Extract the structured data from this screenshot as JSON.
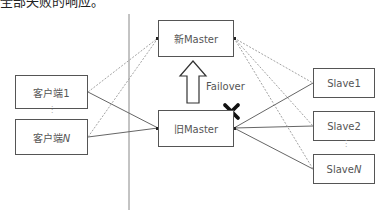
{
  "caption_fragment": "全部失败的响应。",
  "diagram": {
    "clients": [
      {
        "id": "client1",
        "label": "客户端1"
      },
      {
        "id": "clientN",
        "label_prefix": "客户端",
        "label_suffix": "N"
      }
    ],
    "masters": {
      "new": {
        "label": "新Master"
      },
      "old": {
        "label": "旧Master"
      }
    },
    "slaves": [
      {
        "id": "slave1",
        "label": "Slave1"
      },
      {
        "id": "slave2",
        "label": "Slave2"
      },
      {
        "id": "slaveN",
        "label_prefix": "Slave",
        "label_suffix": "N"
      }
    ],
    "failover_label": "Failover",
    "failed_marker": "x-mark",
    "ellipsis": "⋮",
    "connections": {
      "solid": [
        [
          "client1",
          "old"
        ],
        [
          "clientN",
          "old"
        ],
        [
          "old",
          "slave1"
        ],
        [
          "old",
          "slave2"
        ],
        [
          "old",
          "slaveN"
        ]
      ],
      "dotted": [
        [
          "client1",
          "new"
        ],
        [
          "clientN",
          "new"
        ],
        [
          "new",
          "slave1"
        ],
        [
          "new",
          "slave2"
        ],
        [
          "new",
          "slaveN"
        ]
      ]
    }
  }
}
